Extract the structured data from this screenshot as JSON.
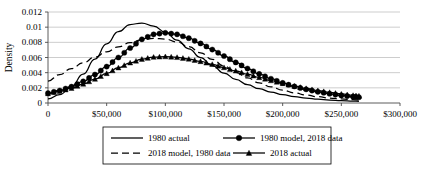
{
  "chart_data": {
    "type": "line",
    "title": "",
    "xlabel": "",
    "ylabel": "Density",
    "xlim": [
      0,
      300000
    ],
    "ylim": [
      0,
      0.012
    ],
    "grid": true,
    "legend_position": "bottom",
    "x_ticks": [
      "0",
      "$50,000",
      "$100,000",
      "$150,000",
      "$200,000",
      "$250,000",
      "$300,000"
    ],
    "x_tick_values": [
      0,
      50000,
      100000,
      150000,
      200000,
      250000,
      300000
    ],
    "y_ticks": [
      "0",
      "0.002",
      "0.004",
      "0.006",
      "0.008",
      "0.01",
      "0.012"
    ],
    "y_tick_values": [
      0,
      0.002,
      0.004,
      0.006,
      0.008,
      0.01,
      0.012
    ],
    "x": [
      0,
      10000,
      20000,
      30000,
      40000,
      50000,
      60000,
      70000,
      80000,
      90000,
      100000,
      110000,
      120000,
      130000,
      140000,
      150000,
      160000,
      170000,
      180000,
      190000,
      200000,
      210000,
      220000,
      230000,
      240000,
      250000,
      260000,
      265000
    ],
    "series": [
      {
        "name": "1980 actual",
        "style": "solid",
        "marker": "none",
        "values": [
          0.00055,
          0.0011,
          0.0022,
          0.0038,
          0.0058,
          0.0078,
          0.0094,
          0.01035,
          0.01055,
          0.01015,
          0.00935,
          0.0083,
          0.00715,
          0.006,
          0.00492,
          0.00395,
          0.00312,
          0.00243,
          0.00188,
          0.00144,
          0.0011,
          0.00084,
          0.00065,
          0.0005,
          0.00039,
          0.00031,
          0.00025,
          0.00022
        ]
      },
      {
        "name": "1980 model, 2018 data",
        "style": "solid",
        "marker": "circle",
        "values": [
          0.0013,
          0.00165,
          0.00215,
          0.00285,
          0.00375,
          0.0048,
          0.006,
          0.00725,
          0.0084,
          0.00905,
          0.00925,
          0.00905,
          0.00855,
          0.00785,
          0.00705,
          0.0062,
          0.00535,
          0.00455,
          0.00383,
          0.0032,
          0.00265,
          0.00218,
          0.0018,
          0.00148,
          0.00122,
          0.001,
          0.00083,
          0.00076
        ]
      },
      {
        "name": "2018 model, 1980 data",
        "style": "dashed",
        "marker": "none",
        "values": [
          0.0029,
          0.00375,
          0.00455,
          0.0053,
          0.00605,
          0.00675,
          0.0074,
          0.00795,
          0.00835,
          0.00852,
          0.00843,
          0.00805,
          0.00742,
          0.00662,
          0.00575,
          0.00487,
          0.00404,
          0.0033,
          0.00266,
          0.00213,
          0.00169,
          0.00133,
          0.00105,
          0.00083,
          0.00066,
          0.00053,
          0.00043,
          0.00039
        ]
      },
      {
        "name": "2018 actual",
        "style": "solid",
        "marker": "triangle",
        "values": [
          0.00125,
          0.00155,
          0.00195,
          0.0025,
          0.00315,
          0.0039,
          0.00465,
          0.0053,
          0.00578,
          0.00605,
          0.00612,
          0.00602,
          0.0058,
          0.00548,
          0.0051,
          0.00468,
          0.00424,
          0.0038,
          0.00337,
          0.00296,
          0.00258,
          0.00223,
          0.00192,
          0.00164,
          0.0014,
          0.00119,
          0.00101,
          0.00093
        ]
      }
    ]
  },
  "legend": {
    "entries": [
      {
        "label": "1980 actual",
        "style": "solid",
        "marker": "none"
      },
      {
        "label": "1980 model, 2018 data",
        "style": "solid",
        "marker": "circle"
      },
      {
        "label": "2018 model, 1980 data",
        "style": "dashed",
        "marker": "none"
      },
      {
        "label": "2018 actual",
        "style": "solid",
        "marker": "triangle"
      }
    ]
  }
}
